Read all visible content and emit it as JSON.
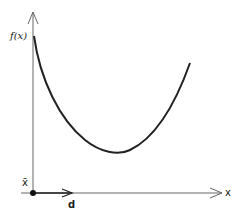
{
  "diagram": {
    "y_axis_label": "f(x)",
    "x_axis_label": "x",
    "point_label": "x̄",
    "direction_label": "d",
    "colors": {
      "axis": "#555555",
      "curve": "#222222",
      "point": "#111111"
    }
  }
}
